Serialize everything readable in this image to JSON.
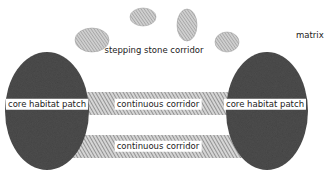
{
  "diagram": {
    "type": "landscape-connectivity",
    "labels": {
      "matrix": "matrix",
      "stepping_stone": "stepping stone corridor",
      "core_left": "core habitat patch",
      "core_right": "core habitat patch",
      "corridor_top": "continuous corridor",
      "corridor_bottom": "continuous corridor"
    },
    "colors": {
      "core_patch": "#4a4a4a",
      "corridor_hatch": "#8a8a8a",
      "stone_fill": "#b5b5b5",
      "background": "#ffffff"
    },
    "elements": [
      {
        "id": "core-left",
        "kind": "core habitat patch"
      },
      {
        "id": "core-right",
        "kind": "core habitat patch"
      },
      {
        "id": "corridor-top",
        "kind": "continuous corridor"
      },
      {
        "id": "corridor-bottom",
        "kind": "continuous corridor"
      },
      {
        "id": "stones",
        "kind": "stepping stone corridor",
        "count": 4
      }
    ]
  }
}
